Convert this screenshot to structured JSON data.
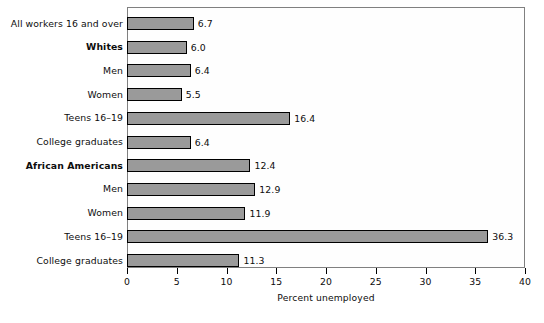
{
  "chart_data": {
    "type": "bar",
    "orientation": "horizontal",
    "title": "",
    "xlabel": "Percent unemployed",
    "ylabel": "",
    "xlim": [
      0,
      40
    ],
    "xticks": [
      0,
      5,
      10,
      15,
      20,
      25,
      30,
      35,
      40
    ],
    "xtick_labels": [
      "0",
      "5",
      "10",
      "15",
      "20",
      "25",
      "30",
      "35",
      "40"
    ],
    "grid": false,
    "legend": false,
    "bar_fill_color": "#9a9a9a",
    "bar_border_color": "#000000",
    "plot_border_color": "#808080",
    "plot_background_color": "#fefefe",
    "categories": [
      "All workers 16 and over",
      "Whites",
      "Men",
      "Women",
      "Teens 16–19",
      "College graduates",
      "African Americans",
      "Men",
      "Women",
      "Teens 16–19",
      "College graduates"
    ],
    "category_styles": [
      "normal",
      "bold",
      "normal",
      "normal",
      "normal",
      "normal",
      "bold",
      "normal",
      "normal",
      "normal",
      "normal"
    ],
    "values": [
      6.7,
      6.0,
      6.4,
      5.5,
      16.4,
      6.4,
      12.4,
      12.9,
      11.9,
      36.3,
      11.3
    ],
    "value_labels": [
      "6.7",
      "6.0",
      "6.4",
      "5.5",
      "16.4",
      "6.4",
      "12.4",
      "12.9",
      "11.9",
      "36.3",
      "11.3"
    ]
  }
}
